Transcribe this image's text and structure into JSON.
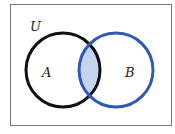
{
  "diagram": {
    "type": "venn",
    "universe_label": "U",
    "sets": [
      {
        "label": "A",
        "stroke": "#111111"
      },
      {
        "label": "B",
        "stroke": "#2f5bb7"
      }
    ],
    "shaded_region": "A ∩ B",
    "shade_color": "#c5d5ef"
  }
}
